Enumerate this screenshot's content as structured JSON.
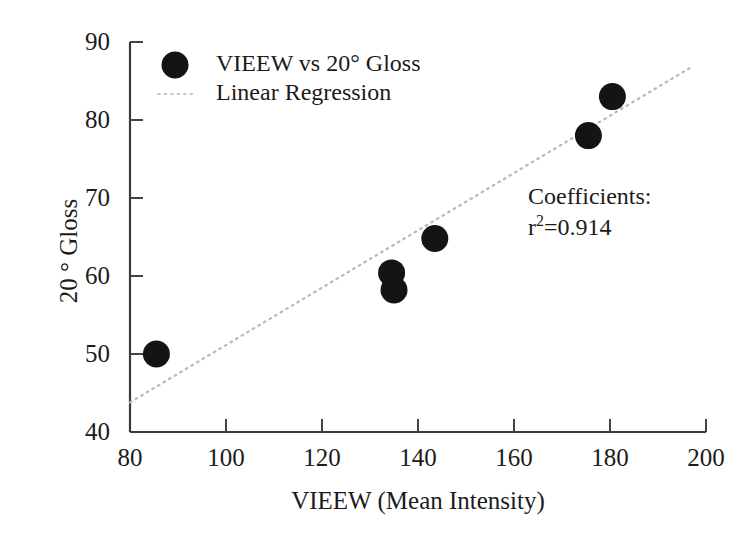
{
  "chart_data": {
    "type": "scatter",
    "title": "",
    "xlabel": "VIEEW (Mean Intensity)",
    "ylabel": "20 ° Gloss",
    "xlim": [
      80,
      200
    ],
    "ylim": [
      40,
      90
    ],
    "xticks": [
      80,
      100,
      120,
      140,
      160,
      180,
      200
    ],
    "yticks": [
      40,
      50,
      60,
      70,
      80,
      90
    ],
    "grid": false,
    "legend_position": "top-left-inside",
    "series": [
      {
        "name": "VIEEW  vs 20° Gloss",
        "type": "scatter",
        "marker": "filled-circle",
        "color": "#141414",
        "points": [
          {
            "x": 85.5,
            "y": 50.0
          },
          {
            "x": 134.5,
            "y": 60.4
          },
          {
            "x": 135.0,
            "y": 58.2
          },
          {
            "x": 143.5,
            "y": 64.8
          },
          {
            "x": 175.5,
            "y": 78.0
          },
          {
            "x": 180.5,
            "y": 83.0
          }
        ]
      },
      {
        "name": "Linear Regression",
        "type": "line",
        "style": "dotted",
        "color": "#b9b9b9",
        "endpoints": [
          {
            "x": 80.0,
            "y": 43.8
          },
          {
            "x": 197.0,
            "y": 86.8
          }
        ]
      }
    ],
    "annotations": [
      {
        "name": "coefficients-title",
        "text": "Coefficients:"
      },
      {
        "name": "r-squared",
        "text": "r ²=0.914",
        "label": "r",
        "superscript": "2",
        "value": "=0.914"
      }
    ]
  },
  "axes": {
    "x": {
      "title": "VIEEW (Mean Intensity)",
      "tick_labels": [
        "80",
        "100",
        "120",
        "140",
        "160",
        "180",
        "200"
      ]
    },
    "y": {
      "title": "20 ° Gloss",
      "tick_labels": [
        "40",
        "50",
        "60",
        "70",
        "80",
        "90"
      ]
    }
  },
  "legend": {
    "series_label": "VIEEW  vs 20° Gloss",
    "fit_label": "Linear Regression"
  },
  "annotation": {
    "coefficients_title": "Coefficients:",
    "r_symbol": "r",
    "r_superscript": "2",
    "r_value": "=0.914"
  },
  "style": {
    "axis_color": "#3a3a3a",
    "marker_color": "#141414",
    "fit_line_color": "#bdbdbd",
    "background": "#ffffff"
  }
}
